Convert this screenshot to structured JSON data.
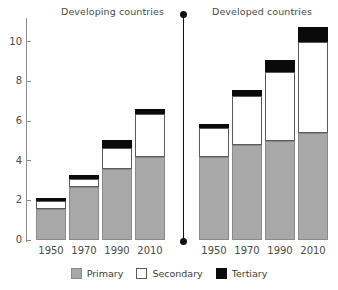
{
  "chart_data": {
    "type": "bar",
    "title": "",
    "subtitle": "",
    "stacked": true,
    "xlabel": "",
    "ylabel": "",
    "ylim": [
      0,
      11.2
    ],
    "yticks": [
      0,
      2,
      4,
      6,
      8,
      10
    ],
    "ytick_labels": [
      "0",
      "2",
      "4",
      "6",
      "8",
      "10"
    ],
    "grid": false,
    "legend_position": "bottom",
    "legend": [
      "Primary",
      "Secondary",
      "Tertiary"
    ],
    "panels": [
      {
        "name": "Developing countries",
        "categories": [
          "1950",
          "1970",
          "1990",
          "2010"
        ],
        "series": [
          {
            "name": "Primary",
            "values": [
              1.55,
              2.65,
              3.6,
              4.2
            ]
          },
          {
            "name": "Secondary",
            "values": [
              0.4,
              0.45,
              1.05,
              2.15
            ]
          },
          {
            "name": "Tertiary",
            "values": [
              0.15,
              0.2,
              0.4,
              0.25
            ]
          }
        ],
        "totals": [
          2.1,
          3.3,
          5.05,
          6.6
        ]
      },
      {
        "name": "Developed countries",
        "categories": [
          "1950",
          "1970",
          "1990",
          "2010"
        ],
        "series": [
          {
            "name": "Primary",
            "values": [
              4.2,
              4.8,
              5.0,
              5.4
            ]
          },
          {
            "name": "Secondary",
            "values": [
              1.45,
              2.45,
              3.5,
              4.6
            ]
          },
          {
            "name": "Tertiary",
            "values": [
              0.2,
              0.3,
              0.6,
              0.75
            ]
          }
        ],
        "totals": [
          5.85,
          7.55,
          9.1,
          10.75
        ]
      }
    ],
    "colors": {
      "primary": "#a8a8a8",
      "secondary": "#ffffff",
      "tertiary": "#0a0a0a",
      "axis": "#8d8d8d",
      "divider": "#111111",
      "text": "#3b3b3b"
    }
  },
  "panel_titles": {
    "left": "Developing countries",
    "right": "Developed countries"
  },
  "legend": {
    "items": [
      {
        "label": "Primary"
      },
      {
        "label": "Secondary"
      },
      {
        "label": "Tertiary"
      }
    ]
  }
}
